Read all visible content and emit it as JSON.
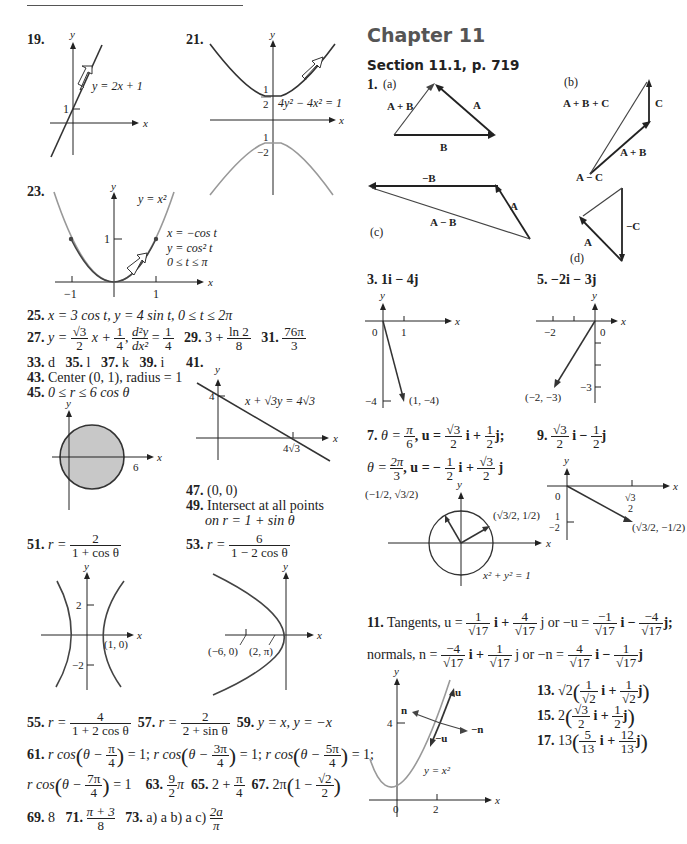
{
  "left_column": {
    "problems": [
      {
        "number": "19.",
        "graph": {
          "equation": "y = 2x + 1",
          "y_intercept_label": "1",
          "x_label": "x",
          "y_label": "y"
        }
      },
      {
        "number": "21.",
        "graph": {
          "equation": "4y² − 4x² = 1",
          "tick_top_num": "1",
          "tick_top_den": "2",
          "tick_bottom_num": "1",
          "tick_bottom_den": "−2",
          "x_label": "x",
          "y_label": "y"
        }
      },
      {
        "number": "23.",
        "graph": {
          "curve_label": "y = x²",
          "param_x": "x = −cos t",
          "param_y": "y = cos² t",
          "param_range": "0 ≤ t ≤ π",
          "tick_y1": "1",
          "tick_xm1": "−1",
          "tick_x1": "1",
          "x_label": "x",
          "y_label": "y"
        }
      },
      {
        "number": "25.",
        "answer": "x = 3 cos t, y = 4 sin t, 0 ≤ t ≤ 2π"
      },
      {
        "number": "27.",
        "answer_parts": {
          "lhs": "y =",
          "f1_num": "√3",
          "f1_den": "2",
          "mid": "x +",
          "f2_num": "1",
          "f2_den": "4",
          "sep": ",",
          "f3_num": "d²y",
          "f3_den": "dx²",
          "eq": "=",
          "f4_num": "1",
          "f4_den": "4"
        }
      },
      {
        "number": "29.",
        "answer_parts": {
          "lhs": "3 +",
          "num": "ln 2",
          "den": "8"
        }
      },
      {
        "number": "31.",
        "answer_parts": {
          "num": "76π",
          "den": "3"
        }
      },
      {
        "number": "33.",
        "answer": "d"
      },
      {
        "number": "35.",
        "answer": "l"
      },
      {
        "number": "37.",
        "answer": "k"
      },
      {
        "number": "39.",
        "answer": "i"
      },
      {
        "number": "41.",
        "graph": {
          "equation": "x + √3y = 4√3",
          "y_tick": "4",
          "x_tick": "4√3",
          "x_label": "x",
          "y_label": "y"
        }
      },
      {
        "number": "43.",
        "answer": "Center (0, 1), radius = 1"
      },
      {
        "number": "45.",
        "answer": "0 ≤ r ≤ 6 cos θ",
        "graph": {
          "x_tick": "6",
          "x_label": "x",
          "y_label": "y",
          "fill_color": "#c8c8c8"
        }
      },
      {
        "number": "47.",
        "answer": "(0, 0)"
      },
      {
        "number": "49.",
        "answer_line1": "Intersect at all points",
        "answer_line2": "on r = 1 +  sin θ"
      },
      {
        "number": "51.",
        "answer_parts": {
          "lhs": "r =",
          "num": "2",
          "den": "1 + cos θ"
        },
        "graph": {
          "tick_2": "2",
          "tick_m2": "−2",
          "point": "(1, 0)",
          "x_label": "x",
          "y_label": "y"
        }
      },
      {
        "number": "53.",
        "answer_parts": {
          "lhs": "r =",
          "num": "6",
          "den": "1 − 2 cos θ"
        },
        "graph": {
          "point1": "(−6, 0)",
          "point2": "(2, π)",
          "x_label": "x",
          "y_label": "y"
        }
      },
      {
        "number": "55.",
        "answer_parts": {
          "lhs": "r =",
          "num": "4",
          "den": "1 + 2 cos θ"
        }
      },
      {
        "number": "57.",
        "answer_parts": {
          "lhs": "r =",
          "num": "2",
          "den": "2 + sin θ"
        }
      },
      {
        "number": "59.",
        "answer": "y = x, y = −x"
      },
      {
        "number": "61.",
        "answer_parts": [
          {
            "pre": "r cos",
            "inner": "θ −",
            "num": "π",
            "den": "4",
            "post": "= 1;"
          },
          {
            "pre": "r cos",
            "inner": "θ −",
            "num": "3π",
            "den": "4",
            "post": "= 1;"
          },
          {
            "pre": "r cos",
            "inner": "θ −",
            "num": "5π",
            "den": "4",
            "post": "= 1;"
          },
          {
            "pre": "r cos",
            "inner": "θ −",
            "num": "7π",
            "den": "4",
            "post": "= 1"
          }
        ]
      },
      {
        "number": "63.",
        "answer_parts": {
          "num": "9",
          "den": "2",
          "post": "π"
        }
      },
      {
        "number": "65.",
        "answer_parts": {
          "lhs": "2 +",
          "num": "π",
          "den": "4"
        }
      },
      {
        "number": "67.",
        "answer_parts": {
          "lhs": "2π",
          "inner": "1 −",
          "num": "√2",
          "den": "2"
        }
      },
      {
        "number": "69.",
        "answer": "8"
      },
      {
        "number": "71.",
        "answer_parts": {
          "num": "π + 3",
          "den": "8"
        }
      },
      {
        "number": "73.",
        "answer_parts": {
          "text": "a) a  b) a  c)",
          "num": "2a",
          "den": "π"
        }
      }
    ]
  },
  "right_column": {
    "chapter_title": "Chapter 11",
    "section_title": "Section 11.1, p. 719",
    "problems": [
      {
        "number": "1.",
        "figures": [
          {
            "label": "(a)",
            "vectors": [
              "A + B",
              "A",
              "B"
            ]
          },
          {
            "label": "(b)",
            "vectors": [
              "A + B + C",
              "C",
              "A + B"
            ]
          },
          {
            "label": "(c)",
            "vectors": [
              "−B",
              "A",
              "A − B"
            ]
          },
          {
            "label": "(d)",
            "vectors": [
              "A − C",
              "A",
              "−C"
            ]
          }
        ]
      },
      {
        "number": "3.",
        "answer": "1i − 4j",
        "graph": {
          "origin": "0",
          "x_tick": "1",
          "y_tick": "−4",
          "point": "(1, −4)",
          "x_label": "x",
          "y_label": "y"
        }
      },
      {
        "number": "5.",
        "answer": "−2i − 3j",
        "graph": {
          "origin": "0",
          "x_tick": "−2",
          "y_tick": "−3",
          "point": "(−2, −3)",
          "x_label": "x",
          "y_label": "y"
        }
      },
      {
        "number": "7.",
        "line1": {
          "lhs": "θ =",
          "t_num": "π",
          "t_den": "6",
          "u": ", u =",
          "a_num": "√3",
          "a_den": "2",
          "mid": "i +",
          "b_num": "1",
          "b_den": "2",
          "end": "j;"
        },
        "line2": {
          "lhs": "θ =",
          "t_num": "2π",
          "t_den": "3",
          "u": ", u = −",
          "a_num": "1",
          "a_den": "2",
          "mid": "i +",
          "b_num": "√3",
          "b_den": "2",
          "end": "j"
        },
        "graph": {
          "point_left": "(−1/2, √3/2)",
          "point_right": "(√3/2, 1/2)",
          "circle_eq": "x² + y² = 1",
          "x_label": "x",
          "y_label": "y"
        }
      },
      {
        "number": "9.",
        "answer_parts": {
          "a_num": "√3",
          "a_den": "2",
          "mid": "i −",
          "b_num": "1",
          "b_den": "2",
          "end": "j"
        },
        "graph": {
          "origin": "0",
          "x_tick_num": "√3",
          "x_tick_den": "2",
          "y_tick_num": "1",
          "y_tick_den": "−2",
          "point": "(√3/2, −1/2)",
          "x_label": "x",
          "y_label": "y"
        }
      },
      {
        "number": "11.",
        "line1": {
          "lead": "Tangents, u =",
          "a_num": "1",
          "a_den": "√17",
          "m1": "i +",
          "b_num": "4",
          "b_den": "√17",
          "m2": "j or  −u =",
          "c_num": "−1",
          "c_den": "√17",
          "m3": "i −",
          "d_num": "−4",
          "d_den": "√17",
          "end": "j;"
        },
        "line2": {
          "lead": "normals, n =",
          "a_num": "−4",
          "a_den": "√17",
          "m1": "i +",
          "b_num": "1",
          "b_den": "√17",
          "m2": "j or  −n =",
          "c_num": "4",
          "c_den": "√17",
          "m3": "i  −",
          "d_num": "1",
          "d_den": "√17",
          "end": "j"
        },
        "graph": {
          "curve": "y = x²",
          "y_tick": "4",
          "x_tick": "2",
          "origin": "0",
          "vectors": [
            "u",
            "−u",
            "n",
            "−n"
          ],
          "x_label": "x",
          "y_label": "y"
        }
      },
      {
        "number": "13.",
        "answer_parts": {
          "coef": "√2",
          "a_num": "1",
          "a_den": "√2",
          "mid": "i +",
          "b_num": "1",
          "b_den": "√2",
          "end": "j"
        }
      },
      {
        "number": "15.",
        "answer_parts": {
          "coef": "2",
          "a_num": "√3",
          "a_den": "2",
          "mid": "i +",
          "b_num": "1",
          "b_den": "2",
          "end": "j"
        }
      },
      {
        "number": "17.",
        "answer_parts": {
          "coef": "13",
          "a_num": "5",
          "a_den": "13",
          "mid": "i +",
          "b_num": "12",
          "b_den": "13",
          "end": "j"
        }
      }
    ]
  },
  "colors": {
    "text": "#222222",
    "heading_gray": "#555555",
    "curve_gray": "#888888",
    "disk_fill": "#c8c8c8"
  }
}
